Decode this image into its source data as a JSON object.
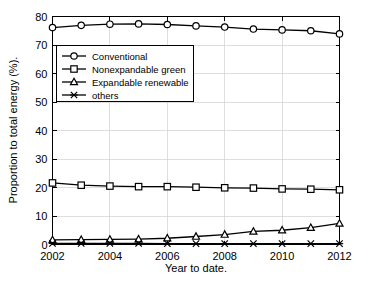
{
  "chart_data": {
    "type": "line",
    "title": "",
    "xlabel": "Year to date.",
    "ylabel": "Proportion to total energy (%).",
    "x": [
      2002,
      2003,
      2004,
      2005,
      2006,
      2007,
      2008,
      2009,
      2010,
      2011,
      2012
    ],
    "xlim": [
      2002,
      2012
    ],
    "ylim": [
      0,
      80
    ],
    "xticks": [
      2002,
      2004,
      2006,
      2008,
      2010,
      2012
    ],
    "xtick_labels": [
      "2002",
      "2004",
      "2006",
      "2008",
      "2010",
      "2012"
    ],
    "yticks": [
      0,
      10,
      20,
      30,
      40,
      50,
      60,
      70,
      80
    ],
    "ytick_labels": [
      "0",
      "10",
      "20",
      "30",
      "40",
      "50",
      "60",
      "70",
      "80"
    ],
    "grid": true,
    "legend_position": "upper left",
    "series": [
      {
        "name": "Conventional",
        "marker": "circle",
        "color": "#000000",
        "values": [
          76.1,
          76.9,
          77.3,
          77.4,
          77.2,
          76.7,
          76.3,
          75.6,
          75.3,
          75.0,
          73.9
        ]
      },
      {
        "name": "Nonexpandable green",
        "marker": "square",
        "color": "#000000",
        "values": [
          21.6,
          20.8,
          20.5,
          20.3,
          20.3,
          20.1,
          19.9,
          19.8,
          19.5,
          19.4,
          19.2
        ]
      },
      {
        "name": "Expandable renewable",
        "marker": "triangle",
        "color": "#000000",
        "values": [
          1.6,
          1.7,
          1.8,
          1.9,
          2.2,
          2.8,
          3.5,
          4.6,
          5.0,
          5.9,
          7.4
        ]
      },
      {
        "name": "others",
        "marker": "x",
        "color": "#000000",
        "values": [
          0.4,
          0.4,
          0.4,
          0.4,
          0.3,
          0.3,
          0.3,
          0.3,
          0.3,
          0.3,
          0.3
        ]
      }
    ]
  },
  "axes": {
    "x_title": "Year to date.",
    "y_title": "Proportion to total energy (%)."
  },
  "legend": {
    "items": [
      {
        "label": "Conventional",
        "marker": "circle-marker"
      },
      {
        "label": "Nonexpandable green",
        "marker": "square-marker"
      },
      {
        "label": "Expandable renewable",
        "marker": "triangle-marker"
      },
      {
        "label": "others",
        "marker": "x-marker"
      }
    ]
  }
}
